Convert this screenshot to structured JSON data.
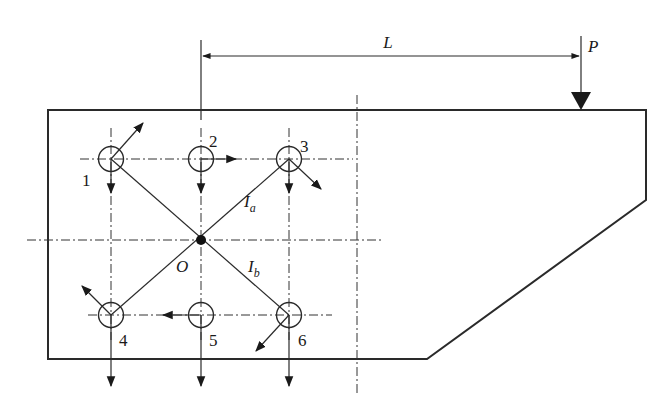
{
  "diagram": {
    "dimension_label": "L",
    "load_label": "P",
    "centroid_label": "O",
    "radius_labels": [
      {
        "main": "I",
        "sub": "a"
      },
      {
        "main": "I",
        "sub": "b"
      }
    ],
    "bolts": [
      {
        "id": "1",
        "label": "1"
      },
      {
        "id": "2",
        "label": "2"
      },
      {
        "id": "3",
        "label": "3"
      },
      {
        "id": "4",
        "label": "4"
      },
      {
        "id": "5",
        "label": "5"
      },
      {
        "id": "6",
        "label": "6"
      }
    ],
    "colors": {
      "line": "#2a2a2a",
      "background": "#ffffff"
    }
  }
}
